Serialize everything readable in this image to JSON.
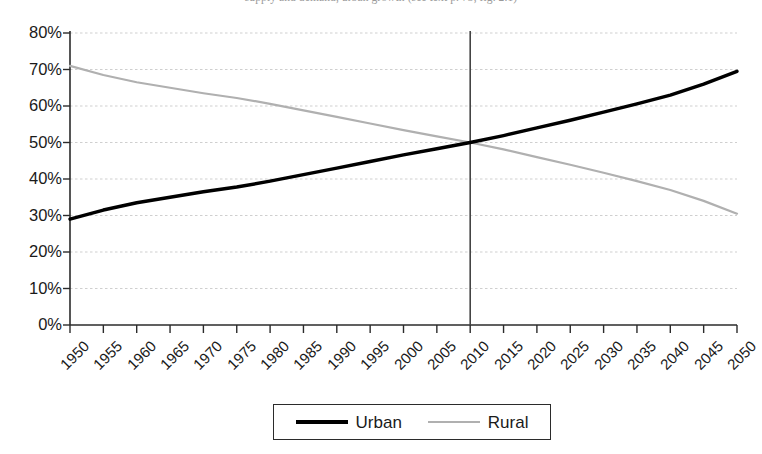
{
  "caption": {
    "text": "supply and demand, urban growth (see text p. 73, fig. 2.1)",
    "visible": "partially-cropped-top-edge"
  },
  "legend": {
    "position": "bottom-center",
    "entries": [
      {
        "label": "Urban",
        "swatch": "thick-black-line",
        "color": "#000000"
      },
      {
        "label": "Rural",
        "swatch": "thin-gray-line",
        "color": "#b0b0b0"
      }
    ]
  },
  "axes": {
    "y_tick_labels": [
      "80%",
      "70%",
      "60%",
      "50%",
      "40%",
      "30%",
      "20%",
      "10%",
      "0%"
    ],
    "x_tick_labels": [
      "1950",
      "1955",
      "1960",
      "1965",
      "1970",
      "1975",
      "1980",
      "1985",
      "1990",
      "1995",
      "2000",
      "2005",
      "2010",
      "2015",
      "2020",
      "2025",
      "2030",
      "2035",
      "2040",
      "2045",
      "2050"
    ]
  },
  "annotations": {
    "reference_line_year": "2010",
    "reference_line_label": "crossover-2010"
  },
  "chart_data": {
    "type": "line",
    "title": "",
    "subtitle": "",
    "xlabel": "",
    "ylabel": "",
    "xlim": [
      1950,
      2050
    ],
    "ylim": [
      0,
      80
    ],
    "yticks": [
      0,
      10,
      20,
      30,
      40,
      50,
      60,
      70,
      80
    ],
    "ytick_format": "percent",
    "grid": "horizontal-dotted-light-gray",
    "legend_position": "bottom-center",
    "x": [
      1950,
      1955,
      1960,
      1965,
      1970,
      1975,
      1980,
      1985,
      1990,
      1995,
      2000,
      2005,
      2010,
      2015,
      2020,
      2025,
      2030,
      2035,
      2040,
      2045,
      2050
    ],
    "series": [
      {
        "name": "Urban",
        "color": "#000000",
        "line_width": 3.4,
        "values": [
          29.0,
          31.5,
          33.5,
          35.0,
          36.5,
          37.8,
          39.4,
          41.2,
          43.0,
          44.8,
          46.6,
          48.3,
          50.0,
          51.9,
          54.0,
          56.1,
          58.3,
          60.6,
          63.0,
          66.0,
          69.5
        ]
      },
      {
        "name": "Rural",
        "color": "#b0b0b0",
        "line_width": 2.2,
        "values": [
          71.0,
          68.5,
          66.5,
          65.0,
          63.5,
          62.2,
          60.6,
          58.8,
          57.0,
          55.2,
          53.4,
          51.7,
          50.0,
          48.1,
          46.0,
          43.9,
          41.7,
          39.4,
          37.0,
          34.0,
          30.5
        ]
      }
    ],
    "annotations": [
      {
        "type": "vline",
        "x": 2010,
        "label": "2010",
        "color": "#444444"
      }
    ]
  }
}
